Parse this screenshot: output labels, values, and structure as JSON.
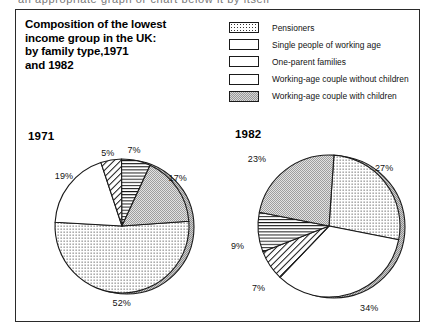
{
  "page": {
    "bleed_text": "an appropriate graph or chart below it by itself"
  },
  "title": "Composition of the lowest income group in the UK: by family type,1971 and 1982",
  "title_lines": [
    "Composition of the lowest",
    "income group in the UK:",
    "by family type,1971",
    "and 1982"
  ],
  "legend": {
    "items": [
      {
        "label": "Pensioners",
        "pattern": "dots",
        "icon": "swatch-dotted"
      },
      {
        "label": "Single people of working age",
        "pattern": "blank",
        "icon": "swatch-blank"
      },
      {
        "label": "One-parent families",
        "pattern": "diagonal",
        "icon": "swatch-diagonal-hatch"
      },
      {
        "label": "Working-age couple without children",
        "pattern": "horizontal",
        "icon": "swatch-horizontal-lines"
      },
      {
        "label": "Working-age couple with children",
        "pattern": "stipple",
        "icon": "swatch-stipple"
      }
    ]
  },
  "colors": {
    "outline": "#1a1a1a",
    "frame": "#2a2a2a",
    "rim_shadow": "#bdbdbd",
    "stipple_fill": "#d8d8d8",
    "text": "#111111"
  },
  "chart_data": [
    {
      "type": "pie",
      "title": "1971",
      "categories": [
        "Pensioners",
        "Single people of working age",
        "One-parent families",
        "Working-age couple without children",
        "Working-age couple with children"
      ],
      "values": [
        52,
        19,
        5,
        7,
        17
      ],
      "labels": [
        "52%",
        "19%",
        "5%",
        "7%",
        "17%"
      ],
      "patterns": [
        "dots",
        "blank",
        "diagonal",
        "horizontal",
        "stipple"
      ],
      "start_angle_deg": -4,
      "legend": "external",
      "grid": false
    },
    {
      "type": "pie",
      "title": "1982",
      "categories": [
        "Pensioners",
        "Single people of working age",
        "One-parent families",
        "Working-age couple without children",
        "Working-age couple with children"
      ],
      "values": [
        27,
        34,
        7,
        9,
        23
      ],
      "labels": [
        "27%",
        "34%",
        "7%",
        "9%",
        "23%"
      ],
      "patterns": [
        "dots",
        "blank",
        "diagonal",
        "horizontal",
        "stipple"
      ],
      "start_angle_deg": -86,
      "legend": "external",
      "grid": false
    }
  ]
}
